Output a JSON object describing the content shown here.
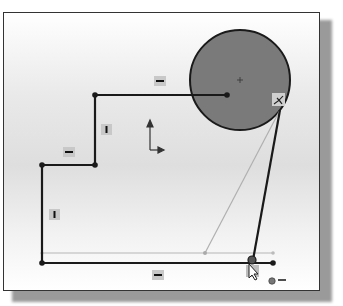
{
  "view": {
    "title": "Sketch canvas",
    "colors": {
      "background_top": "#ffffff",
      "background_mid": "#dedede",
      "circle_fill": "#7a7a7a",
      "sketch_line": "#1a1a1a",
      "preview_line": "#b0b0b0",
      "badge": "#c8c8c8"
    }
  },
  "sketch": {
    "entities": [
      {
        "type": "circle",
        "name": "circle",
        "state": "filled"
      },
      {
        "type": "line",
        "name": "top-horizontal-line",
        "constraint": "horizontal"
      },
      {
        "type": "line",
        "name": "upper-vertical-line",
        "constraint": "vertical"
      },
      {
        "type": "line",
        "name": "middle-horizontal-line",
        "constraint": "horizontal"
      },
      {
        "type": "line",
        "name": "left-vertical-line",
        "constraint": "vertical"
      },
      {
        "type": "line",
        "name": "bottom-horizontal-line",
        "constraint": "horizontal"
      },
      {
        "type": "line",
        "name": "tangent-line",
        "constraint": "tangent"
      }
    ],
    "relation_icons": [
      "horizontal-relation-icon",
      "vertical-relation-icon",
      "tangent-relation-icon",
      "coincident-relation-icon"
    ],
    "cursor": "line-tool-cursor"
  }
}
